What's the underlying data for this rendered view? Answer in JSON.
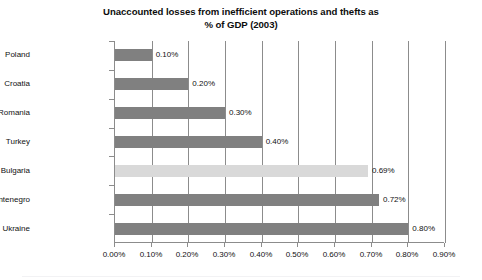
{
  "chart_data": {
    "type": "bar",
    "orientation": "horizontal",
    "title": "Unaccounted losses from inefficient operations and thefts as\n% of GDP (2003)",
    "xlabel": "",
    "ylabel": "",
    "categories": [
      "Poland",
      "Croatia",
      "Romania",
      "Turkey",
      "Bulgaria",
      "Serbia & Montenegro",
      "Ukraine"
    ],
    "values": [
      0.1,
      0.2,
      0.3,
      0.4,
      0.69,
      0.72,
      0.8
    ],
    "value_labels": [
      "0.10%",
      "0.20%",
      "0.30%",
      "0.40%",
      "0.69%",
      "0.72%",
      "0.80%"
    ],
    "bar_colors": [
      "#808080",
      "#808080",
      "#808080",
      "#808080",
      "#d9d9d9",
      "#808080",
      "#808080"
    ],
    "xlim": [
      0.0,
      0.9
    ],
    "xticks": [
      0.0,
      0.1,
      0.2,
      0.3,
      0.4,
      0.5,
      0.6,
      0.7,
      0.8,
      0.9
    ],
    "xtick_labels": [
      "0.00%",
      "0.10%",
      "0.20%",
      "0.30%",
      "0.40%",
      "0.50%",
      "0.60%",
      "0.70%",
      "0.80%",
      "0.90%"
    ],
    "grid": true,
    "grid_axis": "x",
    "legend": false,
    "axis_color": "#8c8c8c",
    "text_color": "#111111",
    "background": "#ffffff"
  }
}
